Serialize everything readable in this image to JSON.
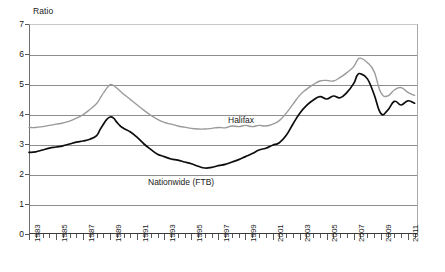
{
  "chart_data": {
    "type": "line",
    "title": "",
    "xlabel": "",
    "ylabel": "Ratio",
    "ylim": [
      0,
      7
    ],
    "xlim": [
      1983,
      2011.75
    ],
    "yticks": [
      0,
      1,
      2,
      3,
      4,
      5,
      6,
      7
    ],
    "grid": true,
    "legend_position": "inline-annotation",
    "xtick_labels": [
      "1983",
      "1985",
      "1987",
      "1989",
      "1991",
      "1993",
      "1995",
      "1997",
      "1999",
      "2001",
      "2003",
      "2005",
      "2007",
      "2009",
      "2011"
    ],
    "xtick_years": [
      1983,
      1985,
      1987,
      1989,
      1991,
      1993,
      1995,
      1997,
      1999,
      2001,
      2003,
      2005,
      2007,
      2009,
      2011
    ],
    "annotations": [
      {
        "text": "Halifax",
        "x": 1999.2,
        "y": 4.05
      },
      {
        "text": "Nationwide (FTB)",
        "x": 1994.0,
        "y": 1.95
      }
    ],
    "series": [
      {
        "name": "Halifax",
        "color": "#9a9a9a",
        "x": [
          1983.0,
          1983.5,
          1984.0,
          1984.5,
          1985.0,
          1985.5,
          1986.0,
          1986.5,
          1987.0,
          1987.5,
          1988.0,
          1988.25,
          1988.5,
          1988.75,
          1989.0,
          1989.25,
          1989.5,
          1989.75,
          1990.0,
          1990.5,
          1991.0,
          1991.5,
          1992.0,
          1992.5,
          1993.0,
          1993.5,
          1994.0,
          1994.5,
          1995.0,
          1995.5,
          1996.0,
          1996.5,
          1997.0,
          1997.5,
          1998.0,
          1998.5,
          1999.0,
          1999.5,
          2000.0,
          2000.5,
          2001.0,
          2001.5,
          2002.0,
          2002.5,
          2003.0,
          2003.5,
          2004.0,
          2004.5,
          2005.0,
          2005.5,
          2006.0,
          2006.5,
          2007.0,
          2007.25,
          2007.5,
          2008.0,
          2008.5,
          2009.0,
          2009.5,
          2010.0,
          2010.5,
          2011.0,
          2011.5
        ],
        "values": [
          3.55,
          3.55,
          3.58,
          3.62,
          3.66,
          3.7,
          3.76,
          3.86,
          3.98,
          4.15,
          4.35,
          4.52,
          4.7,
          4.86,
          4.98,
          4.95,
          4.86,
          4.76,
          4.66,
          4.48,
          4.3,
          4.12,
          3.96,
          3.82,
          3.72,
          3.66,
          3.6,
          3.56,
          3.52,
          3.5,
          3.5,
          3.52,
          3.55,
          3.54,
          3.6,
          3.58,
          3.62,
          3.58,
          3.62,
          3.6,
          3.66,
          3.78,
          4.02,
          4.32,
          4.62,
          4.82,
          4.98,
          5.1,
          5.12,
          5.1,
          5.22,
          5.38,
          5.58,
          5.78,
          5.86,
          5.72,
          5.42,
          4.72,
          4.6,
          4.8,
          4.88,
          4.72,
          4.62
        ]
      },
      {
        "name": "Nationwide (FTB)",
        "color": "#0d0d0d",
        "x": [
          1983.0,
          1983.5,
          1984.0,
          1984.5,
          1985.0,
          1985.5,
          1986.0,
          1986.5,
          1987.0,
          1987.5,
          1988.0,
          1988.25,
          1988.5,
          1988.75,
          1989.0,
          1989.25,
          1989.5,
          1989.75,
          1990.0,
          1990.5,
          1991.0,
          1991.5,
          1992.0,
          1992.5,
          1993.0,
          1993.5,
          1994.0,
          1994.5,
          1995.0,
          1995.5,
          1996.0,
          1996.5,
          1997.0,
          1997.5,
          1998.0,
          1998.5,
          1999.0,
          1999.5,
          2000.0,
          2000.5,
          2001.0,
          2001.5,
          2002.0,
          2002.5,
          2003.0,
          2003.5,
          2004.0,
          2004.5,
          2005.0,
          2005.5,
          2006.0,
          2006.5,
          2007.0,
          2007.25,
          2007.5,
          2008.0,
          2008.5,
          2009.0,
          2009.5,
          2010.0,
          2010.5,
          2011.0,
          2011.5
        ],
        "values": [
          2.72,
          2.74,
          2.8,
          2.86,
          2.9,
          2.94,
          3.0,
          3.06,
          3.1,
          3.16,
          3.28,
          3.48,
          3.66,
          3.82,
          3.9,
          3.86,
          3.72,
          3.6,
          3.52,
          3.4,
          3.22,
          3.0,
          2.82,
          2.66,
          2.58,
          2.5,
          2.46,
          2.4,
          2.34,
          2.26,
          2.2,
          2.22,
          2.28,
          2.32,
          2.4,
          2.48,
          2.58,
          2.68,
          2.8,
          2.86,
          2.96,
          3.04,
          3.28,
          3.66,
          4.02,
          4.28,
          4.46,
          4.58,
          4.5,
          4.6,
          4.54,
          4.72,
          5.02,
          5.28,
          5.34,
          5.18,
          4.66,
          4.02,
          4.12,
          4.42,
          4.3,
          4.44,
          4.36
        ]
      }
    ]
  }
}
